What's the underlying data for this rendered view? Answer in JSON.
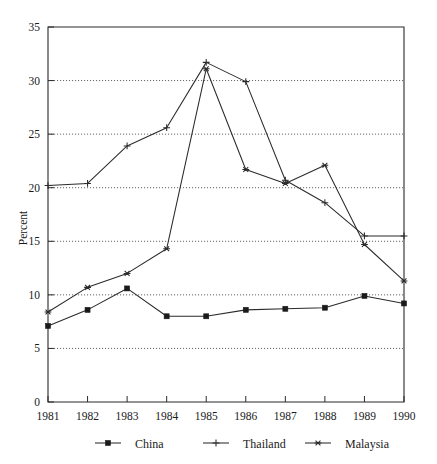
{
  "chart_data": {
    "type": "line",
    "title": "",
    "xlabel": "",
    "ylabel": "Percent",
    "categories": [
      "1981",
      "1982",
      "1983",
      "1984",
      "1985",
      "1986",
      "1987",
      "1988",
      "1989",
      "1990"
    ],
    "x": [
      1981,
      1982,
      1983,
      1984,
      1985,
      1986,
      1987,
      1988,
      1989,
      1990
    ],
    "ylim": [
      0,
      35
    ],
    "yticks": [
      0,
      5,
      10,
      15,
      20,
      25,
      30,
      35
    ],
    "ytick_labels": [
      "0",
      "5",
      "10",
      "15",
      "20",
      "25",
      "30",
      "35"
    ],
    "grid": "horizontal-dotted",
    "legend_position": "bottom",
    "series": [
      {
        "name": "China",
        "marker": "square",
        "values": [
          7.1,
          8.6,
          10.6,
          8.0,
          8.0,
          8.6,
          8.7,
          8.8,
          9.9,
          9.2
        ]
      },
      {
        "name": "Thailand",
        "marker": "plus",
        "values": [
          20.2,
          20.4,
          23.9,
          25.6,
          31.7,
          29.9,
          20.7,
          18.6,
          15.5,
          15.5
        ]
      },
      {
        "name": "Malaysia",
        "marker": "asterisk",
        "values": [
          8.4,
          10.7,
          12.0,
          14.3,
          31.1,
          21.7,
          20.4,
          22.1,
          14.7,
          11.3
        ]
      }
    ]
  },
  "axes": {
    "y_axis_title": "Percent",
    "y_tick_labels": [
      "35",
      "30",
      "25",
      "20",
      "15",
      "10",
      "5",
      "0"
    ],
    "x_tick_labels": [
      "1981",
      "1982",
      "1983",
      "1984",
      "1985",
      "1986",
      "1987",
      "1988",
      "1989",
      "1990"
    ]
  },
  "legend": {
    "items": [
      {
        "label": "China",
        "marker": "square-marker"
      },
      {
        "label": "Thailand",
        "marker": "plus-marker"
      },
      {
        "label": "Malaysia",
        "marker": "asterisk-marker"
      }
    ]
  },
  "colors": {
    "line": "#2b2b2b",
    "text": "#1a1a1a",
    "grid": "#3a3a3a",
    "background": "#ffffff"
  }
}
